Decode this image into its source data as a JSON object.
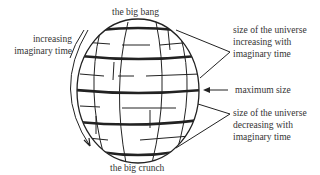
{
  "diagram": {
    "title_top": "the big bang",
    "title_bottom": "the big crunch",
    "left_label": [
      "increasing",
      "imaginary time"
    ],
    "right_labels": {
      "increasing": [
        "size of the universe",
        "increasing with",
        "imaginary time"
      ],
      "maximum": "maximum size",
      "decreasing": [
        "size of the universe",
        "decreasing with",
        "imaginary time"
      ]
    }
  }
}
